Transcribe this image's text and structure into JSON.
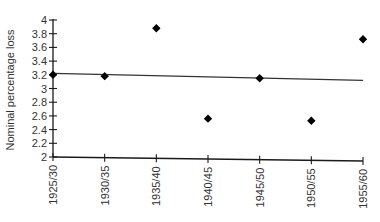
{
  "chart_data": {
    "type": "scatter",
    "title": "",
    "xlabel": "",
    "ylabel": "Nominal percentage loss",
    "categories": [
      "1925/30",
      "1930/35",
      "1935/40",
      "1940/45",
      "1945/50",
      "1950/55",
      "1955/60"
    ],
    "series": [
      {
        "name": "Nominal percentage loss",
        "marker": "diamond",
        "values": [
          3.2,
          3.18,
          3.88,
          2.56,
          3.15,
          2.53,
          3.72
        ]
      },
      {
        "name": "Linear trend",
        "type": "line",
        "start": 3.22,
        "end": 3.12
      }
    ],
    "ylim": [
      2,
      4
    ],
    "yticks": [
      "2",
      "2.2",
      "2.4",
      "2.6",
      "2.8",
      "3",
      "3.2",
      "3.4",
      "3.6",
      "3.8",
      "4"
    ],
    "grid": false,
    "legend": null
  },
  "colors": {
    "axis": "#1a1a1a",
    "marker": "#000000",
    "trend": "#333333",
    "text": "#333333"
  }
}
